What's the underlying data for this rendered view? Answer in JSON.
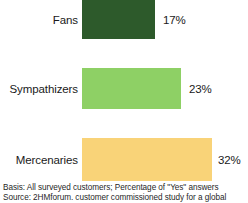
{
  "chart_data": {
    "type": "bar",
    "orientation": "horizontal",
    "title": "",
    "subtitle": "",
    "xlabel": "",
    "ylabel": "",
    "categories": [
      "Fans",
      "Sympathizers",
      "Mercenaries"
    ],
    "values": [
      17,
      23,
      32
    ],
    "value_labels": [
      "17%",
      "23%",
      "32%"
    ],
    "unit": "%",
    "xlim": [
      0,
      32
    ],
    "grid": false,
    "legend": null,
    "colors": [
      "#2d5a2b",
      "#8ed065",
      "#f9d378"
    ],
    "series": [
      {
        "name": "Percentage of \"Yes\" answers",
        "values": [
          17,
          23,
          32
        ]
      }
    ],
    "annotations": [
      "Basis: All surveyed customers; Percentage of \"Yes\" answers",
      "Source: 2HMforum. customer commissioned study for a global"
    ]
  },
  "chart": {
    "bars": [
      {
        "label": "Fans",
        "value_label": "17%",
        "value": 17,
        "color": "#2d5a2b",
        "bar_width_px": 73,
        "value_left_px": 81
      },
      {
        "label": "Sympathizers",
        "value_label": "23%",
        "value": 23,
        "color": "#8ed065",
        "bar_width_px": 99,
        "value_left_px": 107
      },
      {
        "label": "Mercenaries",
        "value_label": "32%",
        "value": 32,
        "color": "#f9d378",
        "bar_width_px": 130,
        "value_left_px": 136
      }
    ]
  },
  "footnote": {
    "line1": "Basis: All surveyed customers; Percentage of \"Yes\" answers",
    "line2": "Source: 2HMforum. customer commissioned study for a global"
  }
}
